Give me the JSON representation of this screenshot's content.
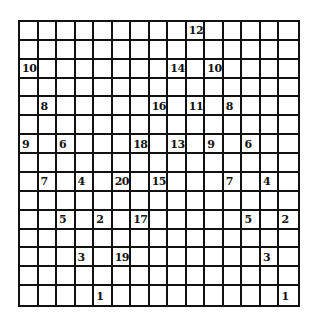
{
  "puzzle": {
    "rows": 15,
    "cols": 15,
    "grid_color": "#111111",
    "background": "#ffffff",
    "clues": [
      {
        "row": 1,
        "col": 10,
        "value": "12"
      },
      {
        "row": 3,
        "col": 1,
        "value": "10"
      },
      {
        "row": 3,
        "col": 9,
        "value": "14"
      },
      {
        "row": 3,
        "col": 11,
        "value": "10"
      },
      {
        "row": 5,
        "col": 2,
        "value": "8"
      },
      {
        "row": 5,
        "col": 8,
        "value": "16"
      },
      {
        "row": 5,
        "col": 10,
        "value": "11"
      },
      {
        "row": 5,
        "col": 12,
        "value": "8"
      },
      {
        "row": 7,
        "col": 1,
        "value": "9"
      },
      {
        "row": 7,
        "col": 3,
        "value": "6"
      },
      {
        "row": 7,
        "col": 7,
        "value": "18"
      },
      {
        "row": 7,
        "col": 9,
        "value": "13"
      },
      {
        "row": 7,
        "col": 11,
        "value": "9"
      },
      {
        "row": 7,
        "col": 13,
        "value": "6"
      },
      {
        "row": 9,
        "col": 2,
        "value": "7"
      },
      {
        "row": 9,
        "col": 4,
        "value": "4"
      },
      {
        "row": 9,
        "col": 6,
        "value": "20"
      },
      {
        "row": 9,
        "col": 8,
        "value": "15"
      },
      {
        "row": 9,
        "col": 12,
        "value": "7"
      },
      {
        "row": 9,
        "col": 14,
        "value": "4"
      },
      {
        "row": 11,
        "col": 3,
        "value": "5"
      },
      {
        "row": 11,
        "col": 5,
        "value": "2"
      },
      {
        "row": 11,
        "col": 7,
        "value": "17"
      },
      {
        "row": 11,
        "col": 13,
        "value": "5"
      },
      {
        "row": 11,
        "col": 15,
        "value": "2"
      },
      {
        "row": 13,
        "col": 4,
        "value": "3"
      },
      {
        "row": 13,
        "col": 6,
        "value": "19"
      },
      {
        "row": 13,
        "col": 14,
        "value": "3"
      },
      {
        "row": 15,
        "col": 5,
        "value": "1"
      },
      {
        "row": 15,
        "col": 15,
        "value": "1"
      }
    ]
  }
}
